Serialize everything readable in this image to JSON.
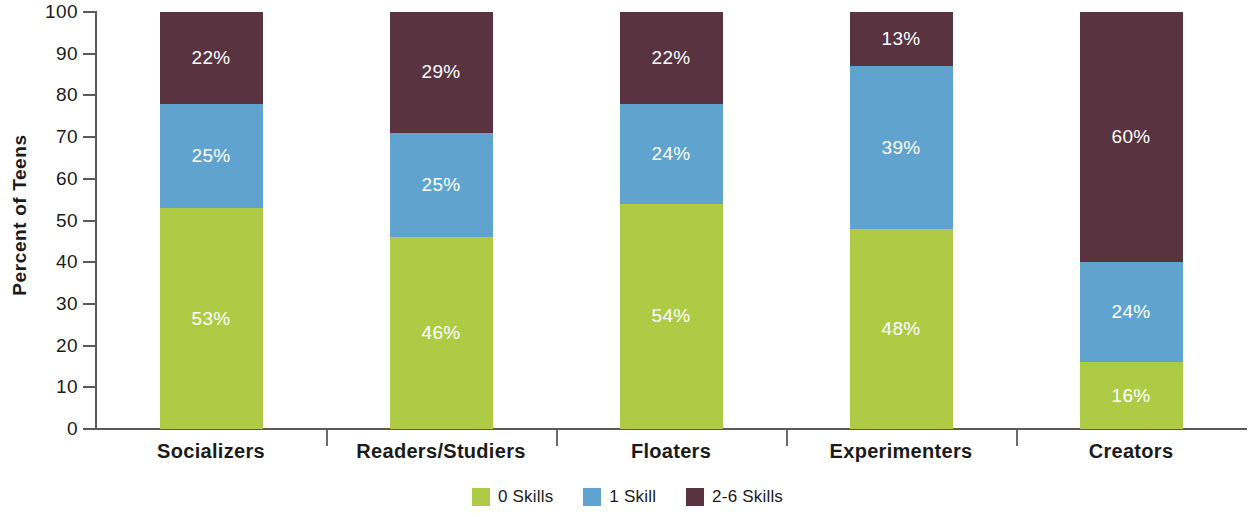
{
  "chart_data": {
    "type": "bar",
    "subtype": "stacked-percent",
    "title": "",
    "xlabel": "",
    "ylabel": "Percent of Teens",
    "ylim": [
      0,
      100
    ],
    "yticks": [
      0,
      10,
      20,
      30,
      40,
      50,
      60,
      70,
      80,
      90,
      100
    ],
    "ytick_labels": [
      "0",
      "10",
      "20",
      "30",
      "40",
      "50",
      "60",
      "70",
      "80",
      "90",
      "100"
    ],
    "grid": false,
    "legend_position": "bottom-center",
    "categories": [
      "Socializers",
      "Readers/Studiers",
      "Floaters",
      "Experimenters",
      "Creators"
    ],
    "series": [
      {
        "name": "0 Skills",
        "color": "#AFCB45",
        "values": [
          53,
          46,
          54,
          48,
          16
        ],
        "labels": [
          "53%",
          "46%",
          "54%",
          "48%",
          "16%"
        ]
      },
      {
        "name": "1 Skill",
        "color": "#5FA3CE",
        "values": [
          25,
          25,
          24,
          39,
          24
        ],
        "labels": [
          "25%",
          "25%",
          "24%",
          "39%",
          "24%"
        ]
      },
      {
        "name": "2-6 Skills",
        "color": "#59333F",
        "values": [
          22,
          29,
          22,
          13,
          60
        ],
        "labels": [
          "22%",
          "29%",
          "22%",
          "13%",
          "60%"
        ]
      }
    ]
  },
  "axis": {
    "y_title": "Percent of Teens"
  },
  "legend": {
    "items": [
      {
        "label": "0 Skills",
        "color": "#AFCB45"
      },
      {
        "label": "1 Skill",
        "color": "#5FA3CE"
      },
      {
        "label": "2-6 Skills",
        "color": "#59333F"
      }
    ]
  },
  "colors": {
    "green": "#AFCB45",
    "blue": "#5FA3CE",
    "plum": "#59333F",
    "axis": "#5a5a5a",
    "text": "#1b1b1b",
    "label_text": "#ffffff",
    "background": "#ffffff"
  }
}
